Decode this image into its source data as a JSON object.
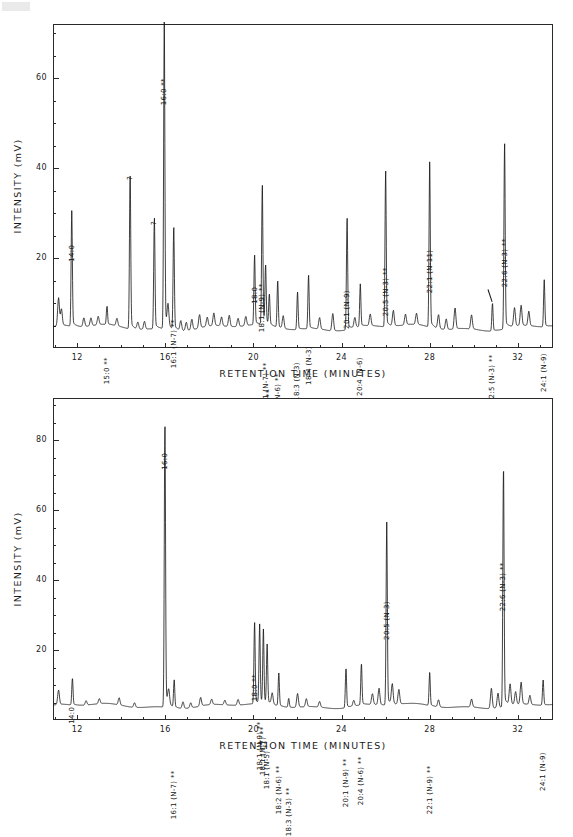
{
  "figure": {
    "panels": [
      {
        "id": "top",
        "chart_data": {
          "type": "line",
          "title": "",
          "xlabel": "RETENTION TIME  (MINUTES)",
          "ylabel": "INTENSITY  (mV)",
          "xlim": [
            10.9,
            33.6
          ],
          "ylim": [
            0,
            72
          ],
          "xticks": [
            12,
            16,
            20,
            24,
            28,
            32
          ],
          "xtick_labels": [
            "12",
            "16",
            "20",
            "24",
            "28",
            "32"
          ],
          "xtick_minor_step": 1,
          "yticks": [
            20,
            40,
            60
          ],
          "ytick_labels": [
            "20",
            "40",
            "60"
          ],
          "ytick_minor_step": 5,
          "grid": false,
          "legend": null,
          "baseline": 4.5,
          "peaks": [
            {
              "label": "",
              "x": 11.15,
              "y": 10.5
            },
            {
              "label": "",
              "x": 11.28,
              "y": 8.0
            },
            {
              "label": "14:0",
              "x": 11.75,
              "y": 29.0,
              "annotated": true
            },
            {
              "label": "",
              "x": 12.3,
              "y": 6.4
            },
            {
              "label": "",
              "x": 12.62,
              "y": 6.2
            },
            {
              "label": "",
              "x": 12.95,
              "y": 6.3
            },
            {
              "label": "15:0  **",
              "x": 13.35,
              "y": 8.5,
              "annotated": true
            },
            {
              "label": "",
              "x": 13.8,
              "y": 6.1
            },
            {
              "label": "?",
              "x": 14.4,
              "y": 38.5,
              "annotated": true
            },
            {
              "label": "",
              "x": 14.75,
              "y": 6.0
            },
            {
              "label": "",
              "x": 15.05,
              "y": 6.2
            },
            {
              "label": "?",
              "x": 15.5,
              "y": 28.5,
              "annotated": true
            },
            {
              "label": "16:0  **",
              "x": 15.95,
              "y": 70.5,
              "annotated": true
            },
            {
              "label": "",
              "x": 16.12,
              "y": 9.0
            },
            {
              "label": "16:1  (N-7)  **",
              "x": 16.38,
              "y": 26.5,
              "annotated": true
            },
            {
              "label": "",
              "x": 16.7,
              "y": 6.6
            },
            {
              "label": "",
              "x": 16.95,
              "y": 6.3
            },
            {
              "label": "",
              "x": 17.2,
              "y": 6.8
            },
            {
              "label": "",
              "x": 17.55,
              "y": 7.4
            },
            {
              "label": "",
              "x": 17.9,
              "y": 6.5
            },
            {
              "label": "",
              "x": 18.2,
              "y": 7.2
            },
            {
              "label": "",
              "x": 18.55,
              "y": 6.4
            },
            {
              "label": "",
              "x": 18.9,
              "y": 6.9
            },
            {
              "label": "",
              "x": 19.3,
              "y": 6.3
            },
            {
              "label": "",
              "x": 19.65,
              "y": 6.5
            },
            {
              "label": "18:0",
              "x": 20.05,
              "y": 19.5,
              "annotated": true
            },
            {
              "label": "18:1  (N-9)  **",
              "x": 20.4,
              "y": 34.5,
              "annotated": true
            },
            {
              "label": "18:1  (N-7)  **",
              "x": 20.55,
              "y": 17.0,
              "annotated": true
            },
            {
              "label": "18:1  (N-5)  **",
              "x": 20.72,
              "y": 11.0,
              "annotated": true
            },
            {
              "label": "18:2  (N-6)  **",
              "x": 21.1,
              "y": 14.5,
              "annotated": true
            },
            {
              "label": "",
              "x": 21.35,
              "y": 7.2
            },
            {
              "label": "18:3  (N-3)",
              "x": 22.0,
              "y": 12.5,
              "annotated": true
            },
            {
              "label": "18:4  (N-3)",
              "x": 22.5,
              "y": 16.0,
              "annotated": true
            },
            {
              "label": "",
              "x": 23.0,
              "y": 7.0
            },
            {
              "label": "",
              "x": 23.6,
              "y": 8.2
            },
            {
              "label": "20:1  (N-9)",
              "x": 24.25,
              "y": 28.5,
              "annotated": true
            },
            {
              "label": "",
              "x": 24.6,
              "y": 6.6
            },
            {
              "label": "20:4  (N-6)",
              "x": 24.85,
              "y": 13.5,
              "annotated": true
            },
            {
              "label": "",
              "x": 25.3,
              "y": 7.0
            },
            {
              "label": "20:5  (N-3)  **",
              "x": 26.0,
              "y": 38.0,
              "annotated": true
            },
            {
              "label": "",
              "x": 26.35,
              "y": 7.8
            },
            {
              "label": "",
              "x": 26.9,
              "y": 6.8
            },
            {
              "label": "",
              "x": 27.4,
              "y": 6.9
            },
            {
              "label": "22:1  (N-11)",
              "x": 28.0,
              "y": 39.5,
              "annotated": true
            },
            {
              "label": "",
              "x": 28.4,
              "y": 7.5
            },
            {
              "label": "",
              "x": 28.75,
              "y": 6.8
            },
            {
              "label": "",
              "x": 29.15,
              "y": 9.0
            },
            {
              "label": "",
              "x": 29.9,
              "y": 7.5
            },
            {
              "label": "22:5  (N-3)  **",
              "x": 30.85,
              "y": 10.5,
              "annotated": true,
              "leader": true
            },
            {
              "label": "22:6  (N-3)  **",
              "x": 31.4,
              "y": 44.5,
              "annotated": true
            },
            {
              "label": "",
              "x": 31.85,
              "y": 8.4
            },
            {
              "label": "",
              "x": 32.15,
              "y": 8.8
            },
            {
              "label": "",
              "x": 32.5,
              "y": 7.6
            },
            {
              "label": "24:1  (N-9)",
              "x": 33.2,
              "y": 14.5,
              "annotated": true
            }
          ]
        }
      },
      {
        "id": "bottom",
        "chart_data": {
          "type": "line",
          "title": "",
          "xlabel": "RETENTION TIME  (MINUTES)",
          "ylabel": "INTENSITY  (mV)",
          "xlim": [
            10.9,
            33.6
          ],
          "ylim": [
            0,
            92
          ],
          "xticks": [
            12,
            16,
            20,
            24,
            28,
            32
          ],
          "xtick_labels": [
            "12",
            "16",
            "20",
            "24",
            "28",
            "32"
          ],
          "xtick_minor_step": 1,
          "yticks": [
            20,
            40,
            60,
            80
          ],
          "ytick_labels": [
            "20",
            "40",
            "60",
            "80"
          ],
          "ytick_minor_step": 5,
          "grid": false,
          "legend": null,
          "baseline": 4.0,
          "peaks": [
            {
              "label": "",
              "x": 11.15,
              "y": 8.0
            },
            {
              "label": "14:0",
              "x": 11.78,
              "y": 11.5,
              "annotated": true
            },
            {
              "label": "",
              "x": 12.4,
              "y": 5.2
            },
            {
              "label": "",
              "x": 13.0,
              "y": 5.4
            },
            {
              "label": "",
              "x": 13.9,
              "y": 6.0
            },
            {
              "label": "",
              "x": 14.6,
              "y": 5.3
            },
            {
              "label": "16:0",
              "x": 15.98,
              "y": 84.0,
              "annotated": true
            },
            {
              "label": "",
              "x": 16.15,
              "y": 8.0
            },
            {
              "label": "16:1  (N-7)  **",
              "x": 16.4,
              "y": 11.5,
              "annotated": true
            },
            {
              "label": "",
              "x": 16.8,
              "y": 5.8
            },
            {
              "label": "",
              "x": 17.15,
              "y": 5.4
            },
            {
              "label": "",
              "x": 17.6,
              "y": 6.4
            },
            {
              "label": "",
              "x": 18.1,
              "y": 5.5
            },
            {
              "label": "",
              "x": 18.7,
              "y": 5.3
            },
            {
              "label": "",
              "x": 19.3,
              "y": 5.6
            },
            {
              "label": "18:0  **",
              "x": 20.05,
              "y": 26.5,
              "annotated": true
            },
            {
              "label": "18:1  (N-9)  **",
              "x": 20.28,
              "y": 25.5,
              "annotated": true
            },
            {
              "label": "18:1  (N-7)  **",
              "x": 20.45,
              "y": 24.0,
              "annotated": true
            },
            {
              "label": "18:1  (N-5)  **",
              "x": 20.62,
              "y": 20.0,
              "annotated": true
            },
            {
              "label": "",
              "x": 20.85,
              "y": 7.0
            },
            {
              "label": "18:2  (N-6)  **",
              "x": 21.15,
              "y": 13.0,
              "annotated": true
            },
            {
              "label": "18:3  (N-3)  **",
              "x": 21.6,
              "y": 6.5,
              "annotated": true
            },
            {
              "label": "",
              "x": 22.0,
              "y": 7.8
            },
            {
              "label": "",
              "x": 22.4,
              "y": 6.2
            },
            {
              "label": "",
              "x": 23.0,
              "y": 5.6
            },
            {
              "label": "20:1  (N-9)  **",
              "x": 24.2,
              "y": 15.0,
              "annotated": true
            },
            {
              "label": "",
              "x": 24.55,
              "y": 5.6
            },
            {
              "label": "20:4  (N-6)  **",
              "x": 24.9,
              "y": 15.5,
              "annotated": true
            },
            {
              "label": "",
              "x": 25.4,
              "y": 7.0
            },
            {
              "label": "",
              "x": 25.7,
              "y": 8.5
            },
            {
              "label": "20:5  (N-3)",
              "x": 26.05,
              "y": 54.0,
              "annotated": true
            },
            {
              "label": "",
              "x": 26.3,
              "y": 9.5
            },
            {
              "label": "",
              "x": 26.6,
              "y": 8.0
            },
            {
              "label": "22:1  (N-9)  **",
              "x": 28.0,
              "y": 13.0,
              "annotated": true
            },
            {
              "label": "",
              "x": 28.4,
              "y": 6.0
            },
            {
              "label": "",
              "x": 29.9,
              "y": 6.2
            },
            {
              "label": "",
              "x": 30.8,
              "y": 9.5
            },
            {
              "label": "",
              "x": 31.1,
              "y": 8.0
            },
            {
              "label": "22:6  (N-3)  **",
              "x": 31.35,
              "y": 71.0,
              "annotated": true
            },
            {
              "label": "",
              "x": 31.65,
              "y": 9.5
            },
            {
              "label": "",
              "x": 31.9,
              "y": 7.5
            },
            {
              "label": "",
              "x": 32.15,
              "y": 10.0
            },
            {
              "label": "",
              "x": 32.55,
              "y": 6.5
            },
            {
              "label": "24:1  (N-9)",
              "x": 33.15,
              "y": 11.0,
              "annotated": true
            }
          ]
        }
      }
    ]
  }
}
